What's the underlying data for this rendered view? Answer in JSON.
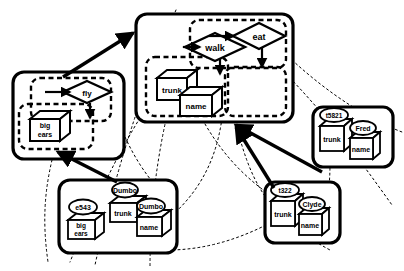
{
  "figure": {
    "title": "",
    "style": {
      "ink": "#000000",
      "paper": "#ffffff"
    }
  },
  "boxes": [
    {
      "id": "box-top",
      "name": "top-center-frame",
      "rect": {
        "x": 136,
        "y": 14,
        "w": 157,
        "h": 108
      },
      "regions": [
        {
          "name": "behavior-region",
          "x": 190,
          "y": 20,
          "w": 96,
          "h": 48
        },
        {
          "name": "attribute-region",
          "x": 146,
          "y": 57,
          "w": 82,
          "h": 59
        },
        {
          "name": "overlap-region",
          "x": 225,
          "y": 67,
          "w": 61,
          "h": 49
        }
      ],
      "diamonds": [
        {
          "label": "walk",
          "cx": 215,
          "cy": 47
        },
        {
          "label": "eat",
          "cx": 259,
          "cy": 36
        }
      ],
      "cubes": [
        {
          "label": "trunk",
          "x": 157,
          "y": 72
        },
        {
          "label": "name",
          "x": 180,
          "y": 87
        }
      ]
    },
    {
      "id": "box-left",
      "name": "left-frame",
      "rect": {
        "x": 13,
        "y": 72,
        "w": 111,
        "h": 87
      },
      "regions": [
        {
          "name": "behavior-region",
          "x": 31,
          "y": 78,
          "w": 80,
          "h": 43
        },
        {
          "name": "attribute-region",
          "x": 19,
          "y": 104,
          "w": 74,
          "h": 45
        }
      ],
      "diamonds": [
        {
          "label": "fly",
          "cx": 87,
          "cy": 92
        }
      ],
      "cubes": [
        {
          "label": "big ears",
          "x": 30,
          "y": 112
        }
      ]
    },
    {
      "id": "box-bottom",
      "name": "bottom-center-frame",
      "rect": {
        "x": 59,
        "y": 180,
        "w": 118,
        "h": 73
      },
      "regions": [],
      "diamonds": [],
      "cubes": [
        {
          "label": "big ears",
          "x": 68,
          "y": 213,
          "tag": "e543"
        },
        {
          "label": "trunk",
          "x": 110,
          "y": 196,
          "tag": "t87"
        },
        {
          "label": "name",
          "x": 137,
          "y": 210,
          "tag": "Dumbo"
        }
      ]
    },
    {
      "id": "box-right",
      "name": "right-frame",
      "rect": {
        "x": 313,
        "y": 107,
        "w": 80,
        "h": 60
      },
      "regions": [],
      "diamonds": [],
      "cubes": [
        {
          "label": "trunk",
          "x": 320,
          "y": 119,
          "tag": "t5821"
        },
        {
          "label": "name",
          "x": 350,
          "y": 129,
          "tag": "Fred"
        }
      ]
    },
    {
      "id": "box-bottom-right",
      "name": "bottom-right-frame",
      "rect": {
        "x": 265,
        "y": 182,
        "w": 75,
        "h": 61
      },
      "regions": [],
      "diamonds": [],
      "cubes": [
        {
          "label": "trunk",
          "x": 271,
          "y": 193,
          "tag": "t322"
        },
        {
          "label": "name",
          "x": 299,
          "y": 205,
          "tag": "Clyde"
        }
      ]
    }
  ],
  "arrows": [
    {
      "name": "arrow-left-to-top",
      "x1": 63,
      "y1": 77,
      "x2": 133,
      "y2": 33
    },
    {
      "name": "arrow-bottom-to-left",
      "x1": 117,
      "y1": 182,
      "x2": 58,
      "y2": 152
    },
    {
      "name": "arrow-right-to-top",
      "x1": 322,
      "y1": 172,
      "x2": 234,
      "y2": 124
    },
    {
      "name": "arrow-bottom-right-to-top",
      "x1": 274,
      "y1": 188,
      "x2": 234,
      "y2": 126
    }
  ],
  "internal_arrows": [
    {
      "name": "arrow-into-walk",
      "x1": 185,
      "y1": 47,
      "x2": 202,
      "y2": 47
    },
    {
      "name": "arrow-into-eat",
      "x1": 210,
      "y1": 36,
      "x2": 236,
      "y2": 36
    },
    {
      "name": "arrow-walk-down",
      "x1": 220,
      "y1": 58,
      "x2": 220,
      "y2": 73
    },
    {
      "name": "arrow-eat-down",
      "x1": 262,
      "y1": 47,
      "x2": 262,
      "y2": 66
    },
    {
      "name": "arrow-into-fly",
      "x1": 45,
      "y1": 92,
      "x2": 73,
      "y2": 92
    },
    {
      "name": "arrow-fly-down",
      "x1": 90,
      "y1": 103,
      "x2": 90,
      "y2": 117
    }
  ],
  "instance_links": [
    {
      "name": "link-e543-to-big-ears"
    },
    {
      "name": "link-t87-to-trunk"
    },
    {
      "name": "link-t5821-to-trunk"
    },
    {
      "name": "link-t322-to-trunk"
    }
  ]
}
